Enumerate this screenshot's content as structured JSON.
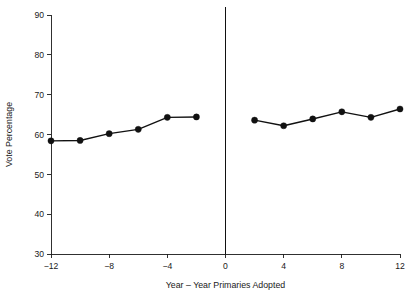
{
  "chart_data": {
    "type": "line",
    "title": "",
    "xlabel": "Year – Year Primaries Adopted",
    "ylabel": "Vote Percentage",
    "xlim": [
      -13.5,
      13.5
    ],
    "ylim": [
      28.0,
      93.0
    ],
    "xticks": [
      -12,
      -8,
      -4,
      0,
      4,
      8,
      12
    ],
    "xtick_labels": [
      "−12",
      "−8",
      "−4",
      "0",
      "4",
      "8",
      "12"
    ],
    "yticks": [
      30,
      40,
      50,
      60,
      70,
      80,
      90
    ],
    "ytick_labels": [
      "30",
      "40",
      "50",
      "60",
      "70",
      "80",
      "90"
    ],
    "grid": false,
    "legend": "none",
    "annotations": [
      {
        "name": "reference-vline",
        "type": "vline",
        "x": 0,
        "label": ""
      }
    ],
    "series": [
      {
        "name": "Before primaries adopted",
        "x": [
          -12,
          -10,
          -8,
          -6,
          -4,
          -2
        ],
        "values": [
          58.4,
          58.5,
          60.2,
          61.3,
          64.3,
          64.4
        ],
        "marker": "circle",
        "color": "#111111"
      },
      {
        "name": "After primaries adopted",
        "x": [
          2,
          4,
          6,
          8,
          10,
          12
        ],
        "values": [
          63.6,
          62.2,
          63.9,
          65.7,
          64.3,
          66.4
        ],
        "marker": "circle",
        "color": "#111111"
      }
    ]
  },
  "colors": {
    "background": "#ffffff",
    "ink": "#111111",
    "axis": "#1a1a1a"
  }
}
